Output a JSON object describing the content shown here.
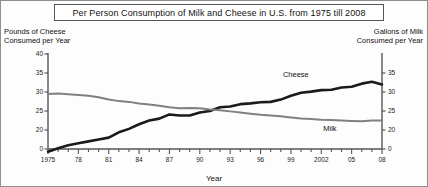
{
  "title": "Per Person Consumption of Milk and Cheese in U.S. from 1975 till 2008",
  "left_caption_line1": "Pounds of Cheese",
  "left_caption_line2": "Consumed per Year",
  "right_caption_line1": "Gallons of Milk",
  "right_caption_line2": "Consumed per Year",
  "xaxis_title": "Year",
  "series_labels": {
    "cheese": "Cheese",
    "milk": "Milk"
  },
  "colors": {
    "cheese_line": "#1a1a1a",
    "milk_line": "#808080",
    "axis": "#555555",
    "border": "#8e8e8e",
    "background": "#fdfdfd",
    "text": "#111111"
  },
  "chart_data": {
    "type": "line",
    "title": "Per Person Consumption of Milk and Cheese in U.S. from 1975 till 2008",
    "xlabel": "Year",
    "ylabel": "Pounds of Cheese Consumed per Year",
    "y2label": "Gallons of Milk Consumed per Year",
    "grid": false,
    "legend": "inline-labels",
    "x": [
      1975,
      1976,
      1977,
      1978,
      1979,
      1980,
      1981,
      1982,
      1983,
      1984,
      1985,
      1986,
      1987,
      1988,
      1989,
      1990,
      1991,
      1992,
      1993,
      1994,
      1995,
      1996,
      1997,
      1998,
      1999,
      2000,
      2001,
      2002,
      2003,
      2004,
      2005,
      2006,
      2007,
      2008
    ],
    "xtick_values": [
      1975,
      1978,
      1981,
      1984,
      1987,
      1990,
      1993,
      1996,
      1999,
      2002,
      2005,
      2008
    ],
    "xtick_labels": [
      "1975",
      "78",
      "81",
      "84",
      "87",
      "90",
      "93",
      "96",
      "99",
      "2002",
      "05",
      "08"
    ],
    "ylim": [
      0,
      40
    ],
    "ytick_values": [
      0,
      20,
      25,
      30,
      35,
      40
    ],
    "ytick_labels": [
      "0",
      "20",
      "25",
      "30",
      "35",
      "40"
    ],
    "y2lim": [
      0,
      35
    ],
    "y2tick_values": [
      0,
      20,
      25,
      30,
      35
    ],
    "y2tick_labels": [
      "0",
      "20",
      "25",
      "30",
      "35"
    ],
    "series": [
      {
        "name": "Cheese",
        "axis": "left",
        "units": "pounds per year",
        "color": "#1a1a1a",
        "values": [
          14.3,
          15.2,
          16.0,
          16.5,
          17.0,
          17.5,
          18.0,
          19.4,
          20.3,
          21.5,
          22.5,
          23.0,
          24.1,
          23.8,
          23.8,
          24.6,
          25.0,
          26.0,
          26.2,
          26.8,
          27.0,
          27.3,
          27.4,
          28.0,
          29.0,
          29.8,
          30.1,
          30.5,
          30.6,
          31.2,
          31.4,
          32.2,
          32.7,
          32.0
        ]
      },
      {
        "name": "Milk",
        "axis": "right",
        "units": "gallons per year",
        "color": "#808080",
        "values": [
          29.5,
          29.6,
          29.4,
          29.2,
          29.0,
          28.6,
          28.0,
          27.6,
          27.4,
          27.0,
          26.7,
          26.4,
          26.0,
          25.7,
          25.8,
          25.7,
          25.4,
          25.2,
          24.9,
          24.6,
          24.3,
          24.0,
          23.8,
          23.6,
          23.3,
          23.0,
          22.9,
          22.7,
          22.6,
          22.5,
          22.4,
          22.3,
          22.5,
          22.5
        ]
      }
    ],
    "annotations": [
      {
        "text": "Cheese",
        "x": 2000,
        "note": "inline label above cheese line"
      },
      {
        "text": "Milk",
        "x": 2003,
        "note": "inline label below milk line"
      }
    ]
  }
}
